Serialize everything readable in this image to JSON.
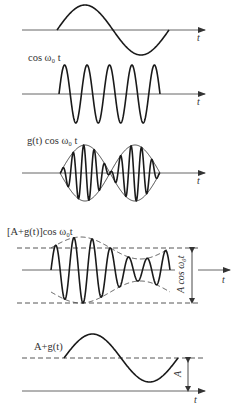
{
  "panels": [
    {
      "id": "message",
      "label": "",
      "axis_label": "t"
    },
    {
      "id": "carrier",
      "label": "cos ω₀ t",
      "axis_label": "t"
    },
    {
      "id": "dsb",
      "label": "g(t) cos ω₀ t",
      "axis_label": "t"
    },
    {
      "id": "am",
      "label": "[A+g(t)]cos ω₀t",
      "axis_label": "t",
      "vertical_annotation": "A cos ω₀t"
    },
    {
      "id": "envelope",
      "label": "A+g(t)",
      "axis_label": "t",
      "vertical_annotation": "A"
    }
  ],
  "colors": {
    "stroke": "#1a1a1a",
    "axis": "#555555",
    "background": "#ffffff"
  }
}
